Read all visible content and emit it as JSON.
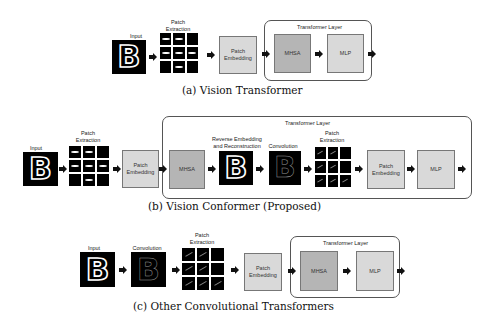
{
  "panels": {
    "a": {
      "caption": "(a) Vision Transformer",
      "input_label": "Input",
      "patch_extraction_label": "Patch\nExtraction",
      "patch_embedding_label": "Patch Embedding",
      "transformer_layer_label": "Transformer Layer",
      "mhsa_label": "MHSA",
      "mlp_label": "MLP"
    },
    "b": {
      "caption": "(b) Vision Conformer (Proposed)",
      "input_label": "Input",
      "patch_extraction_label": "Patch\nExtraction",
      "patch_embedding_label": "Patch Embedding",
      "transformer_layer_label": "Transformer Layer",
      "mhsa_label": "MHSA",
      "reverse_label": "Reverse Embedding\nand Reconstruction",
      "convolution_label": "Convolution",
      "patch_extraction2_label": "Patch\nExtraction",
      "patch_embedding2_label": "Patch Embedding",
      "mlp_label": "MLP"
    },
    "c": {
      "caption": "(c) Other Convolutional Transformers",
      "input_label": "Input",
      "convolution_label": "Convolution",
      "patch_extraction_label": "Patch\nExtraction",
      "patch_embedding_label": "Patch Embedding",
      "transformer_layer_label": "Transformer Layer",
      "mhsa_label": "MHSA",
      "mlp_label": "MLP"
    }
  },
  "glyph": "B",
  "colors": {
    "embedding_fill": "#d9d9d9",
    "block_fill": "#b5b5b5",
    "border": "#777777",
    "image_bg": "#000000"
  }
}
